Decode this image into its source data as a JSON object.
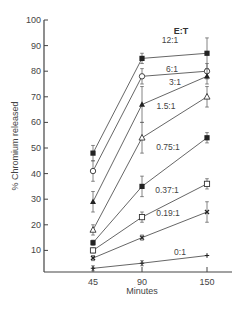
{
  "chart_data": {
    "type": "line",
    "title": "",
    "legend_title": "E:T",
    "xlabel": "Minutes",
    "ylabel": "% Chromium released",
    "x": [
      45,
      90,
      150
    ],
    "x_ticks": [
      "45",
      "90",
      "150"
    ],
    "y_ticks": [
      10,
      20,
      30,
      40,
      50,
      60,
      70,
      80,
      90,
      100
    ],
    "ylim": [
      0,
      100
    ],
    "grid": false,
    "series": [
      {
        "name": "12:1",
        "marker": "filled-square",
        "values": [
          48,
          85,
          87
        ],
        "errors": [
          3,
          2,
          6
        ]
      },
      {
        "name": "6:1",
        "marker": "open-circle",
        "values": [
          41,
          78,
          80
        ],
        "errors": [
          4,
          3,
          3
        ]
      },
      {
        "name": "3:1",
        "marker": "filled-triangle",
        "values": [
          29,
          67,
          78
        ],
        "errors": [
          4,
          7,
          3
        ]
      },
      {
        "name": "1.5:1",
        "marker": "open-triangle",
        "values": [
          18,
          54,
          70
        ],
        "errors": [
          2,
          6,
          4
        ]
      },
      {
        "name": "0.75:1",
        "marker": "filled-square",
        "values": [
          13,
          35,
          54
        ],
        "errors": [
          1,
          4,
          2
        ]
      },
      {
        "name": "0.37:1",
        "marker": "open-square",
        "values": [
          10,
          23,
          36
        ],
        "errors": [
          1,
          2,
          2
        ]
      },
      {
        "name": "0.19:1",
        "marker": "cross",
        "values": [
          7,
          15,
          25
        ],
        "errors": [
          1,
          1,
          4
        ]
      },
      {
        "name": "0:1",
        "marker": "plus",
        "values": [
          3,
          5,
          8
        ],
        "errors": [
          1,
          1,
          0
        ]
      }
    ],
    "label_positions": [
      {
        "name": "12:1",
        "x": 170,
        "y": 43
      },
      {
        "name": "6:1",
        "x": 172,
        "y": 72
      },
      {
        "name": "3:1",
        "x": 175,
        "y": 85
      },
      {
        "name": "1.5:1",
        "x": 166,
        "y": 109
      },
      {
        "name": "0.75:1",
        "x": 168,
        "y": 150
      },
      {
        "name": "0.37:1",
        "x": 167,
        "y": 193
      },
      {
        "name": "0.19:1",
        "x": 168,
        "y": 216
      },
      {
        "name": "0:1",
        "x": 180,
        "y": 255
      }
    ]
  }
}
